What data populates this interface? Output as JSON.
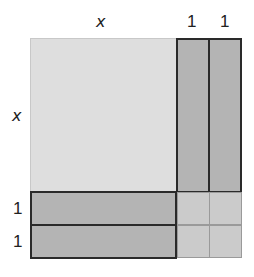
{
  "diagram": {
    "type": "algebra-tile-area-model",
    "expression": "(x + 2)^2 = x^2 + 4x + 4",
    "top_labels": [
      "x",
      "1",
      "1"
    ],
    "left_labels": [
      "x",
      "1",
      "1"
    ],
    "tiles": {
      "x_squared": {
        "count": 1,
        "color": "#dedede",
        "label": "x^2"
      },
      "x_bars": {
        "count": 4,
        "color": "#b4b4b4",
        "label": "x"
      },
      "unit_squares": {
        "count": 4,
        "color": "#cbcbcb",
        "label": "1"
      }
    },
    "colors": {
      "border_dark": "#2a2a2a",
      "border_light": "#9a9a9a"
    }
  }
}
